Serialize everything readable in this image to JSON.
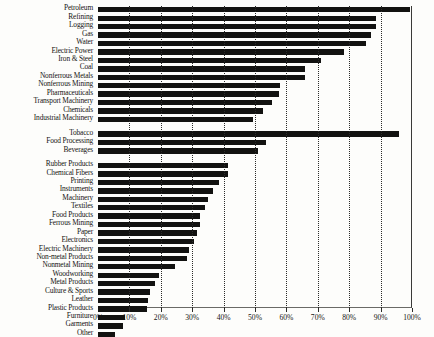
{
  "chart_data": {
    "type": "bar",
    "orientation": "horizontal",
    "title": "",
    "xlabel": "",
    "ylabel": "",
    "xlim": [
      0,
      100
    ],
    "xticks": [
      0,
      10,
      20,
      30,
      40,
      50,
      60,
      70,
      80,
      90,
      100
    ],
    "xtick_labels": [
      "0%",
      "10%",
      "20%",
      "30%",
      "40%",
      "50%",
      "60%",
      "70%",
      "80%",
      "90%",
      "100%"
    ],
    "grid": true,
    "grid_style": "dotted-vertical",
    "legend": null,
    "bar_color": "#121210",
    "categories": [
      "Petroleum",
      "Refining",
      "Logging",
      "Gas",
      "Water",
      "Electric Power",
      "Iron & Steel",
      "Coal",
      "Nonferrous Metals",
      "Nonferrous Mining",
      "Pharmaceuticals",
      "Transport Machinery",
      "Chemicals",
      "Industrial Machinery",
      "Tobacco",
      "Food Processing",
      "Beverages",
      "Rubber Products",
      "Chemical Fibers",
      "Printing",
      "Instruments",
      "Machinery",
      "Textiles",
      "Food Products",
      "Ferrous Mining",
      "Paper",
      "Electronics",
      "Electric Machinery",
      "Non-metal Products",
      "Nonmetal Mining",
      "Woodworking",
      "Metal Products",
      "Culture & Sports",
      "Leather",
      "Plastic Products",
      "Furniture",
      "Garments",
      "Other"
    ],
    "values": [
      99.5,
      88.5,
      88.5,
      87.0,
      85.5,
      78.5,
      71.0,
      66.0,
      66.0,
      58.0,
      57.5,
      55.5,
      52.5,
      49.5,
      96.0,
      53.5,
      51.0,
      41.5,
      41.5,
      38.5,
      36.5,
      35.0,
      34.0,
      32.5,
      32.5,
      31.5,
      30.5,
      29.0,
      28.5,
      24.5,
      19.5,
      18.0,
      16.5,
      16.0,
      15.5,
      8.5,
      8.0,
      5.5
    ],
    "group_breaks": [
      14,
      17
    ]
  }
}
